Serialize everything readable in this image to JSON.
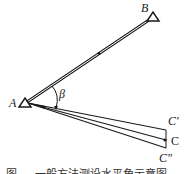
{
  "diagram": {
    "type": "angle-stakeout",
    "points": {
      "A": {
        "label": "A",
        "x": 25,
        "y": 103
      },
      "B": {
        "label": "B",
        "x": 153,
        "y": 17
      },
      "C": {
        "label": "C",
        "x": 166,
        "y": 140
      },
      "C_prime": {
        "label": "C'",
        "x": 166,
        "y": 131
      },
      "C_double_prime": {
        "label": "C\"",
        "x": 166,
        "y": 148
      }
    },
    "angle_label": "β",
    "caption": "图 — 一般方法测设水平角示意图"
  },
  "colors": {
    "line": "#1a1a1a",
    "background": "#ffffff"
  }
}
